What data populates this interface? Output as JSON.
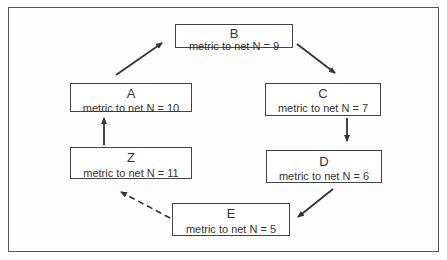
{
  "diagram": {
    "type": "cycle-flow",
    "nodes": [
      {
        "id": "B",
        "title": "B",
        "metric": "metric to net N = 9"
      },
      {
        "id": "A",
        "title": "A",
        "metric": "metric to net N = 10"
      },
      {
        "id": "C",
        "title": "C",
        "metric": "metric to net N = 7"
      },
      {
        "id": "Z",
        "title": "Z",
        "metric": "metric to net N = 11"
      },
      {
        "id": "D",
        "title": "D",
        "metric": "metric to net N = 6"
      },
      {
        "id": "E",
        "title": "E",
        "metric": "metric to net N = 5"
      }
    ],
    "edges": [
      {
        "from": "A",
        "to": "B",
        "style": "solid"
      },
      {
        "from": "B",
        "to": "C",
        "style": "solid"
      },
      {
        "from": "C",
        "to": "D",
        "style": "solid"
      },
      {
        "from": "D",
        "to": "E",
        "style": "solid"
      },
      {
        "from": "E",
        "to": "Z",
        "style": "dashed"
      },
      {
        "from": "Z",
        "to": "A",
        "style": "solid"
      }
    ],
    "colors": {
      "stroke": "#333333",
      "background": "#ffffff"
    }
  }
}
